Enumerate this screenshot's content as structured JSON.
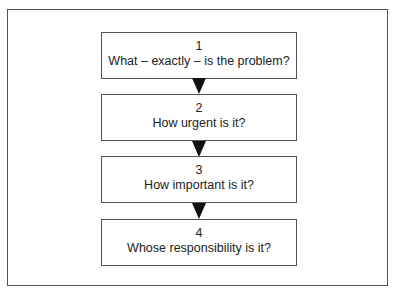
{
  "header": {
    "cutoff_text": "Figure: the four questions to ask about any problem"
  },
  "diagram": {
    "type": "flowchart",
    "direction": "top-to-bottom",
    "steps": [
      {
        "number": "1",
        "question": "What – exactly – is the problem?"
      },
      {
        "number": "2",
        "question": "How urgent is it?"
      },
      {
        "number": "3",
        "question": "How important is it?"
      },
      {
        "number": "4",
        "question": "Whose responsibility is it?"
      }
    ],
    "colors": {
      "border": "#555555",
      "arrow": "#111111",
      "text": "#222222",
      "background": "#ffffff"
    }
  }
}
